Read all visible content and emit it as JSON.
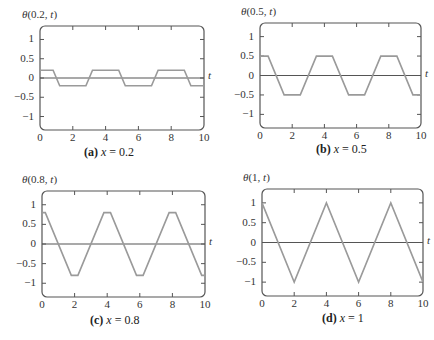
{
  "colors": {
    "frame": "#555555",
    "axis_line": "#555555",
    "curve": "#9a9a9a",
    "text": "#333333"
  },
  "chart_data": [
    {
      "type": "line",
      "panel": "a",
      "title": "θ(0.2, t)",
      "title_func": "θ",
      "title_args": "(0.2, ",
      "title_var": "t",
      "caption_tag": "(a)",
      "caption_var": "x",
      "caption_eq": " = 0.2",
      "xlabel": "t",
      "ylabel": "θ(0.2, t)",
      "xlim": [
        0,
        10
      ],
      "ylim": [
        -1.35,
        1.35
      ],
      "xticks": [
        0,
        2,
        4,
        6,
        8,
        10
      ],
      "yticks": [
        1,
        0.5,
        0,
        -0.5,
        -1
      ],
      "ytick_labels": [
        "1",
        "0.5",
        "0",
        "−0.5",
        "−1"
      ],
      "grid": false,
      "x": [
        0,
        0.8,
        1.2,
        2.8,
        3.2,
        4.8,
        5.2,
        6.8,
        7.2,
        8.8,
        9.2,
        10
      ],
      "y": [
        0.2,
        0.2,
        -0.2,
        -0.2,
        0.2,
        0.2,
        -0.2,
        -0.2,
        0.2,
        0.2,
        -0.2,
        -0.2
      ]
    },
    {
      "type": "line",
      "panel": "b",
      "title": "θ(0.5, t)",
      "title_func": "θ",
      "title_args": "(0.5, ",
      "title_var": "t",
      "caption_tag": "(b)",
      "caption_var": "x",
      "caption_eq": " = 0.5",
      "xlabel": "t",
      "ylabel": "θ(0.5, t)",
      "xlim": [
        0,
        10
      ],
      "ylim": [
        -1.35,
        1.35
      ],
      "xticks": [
        0,
        2,
        4,
        6,
        8,
        10
      ],
      "yticks": [
        1,
        0.5,
        0,
        -0.5,
        -1
      ],
      "ytick_labels": [
        "1",
        "0.5",
        "0",
        "−0.5",
        "−1"
      ],
      "grid": false,
      "x": [
        0,
        0.5,
        1.5,
        2.5,
        3.5,
        4.5,
        5.5,
        6.5,
        7.5,
        8.5,
        9.5,
        10
      ],
      "y": [
        0.5,
        0.5,
        -0.5,
        -0.5,
        0.5,
        0.5,
        -0.5,
        -0.5,
        0.5,
        0.5,
        -0.5,
        -0.5
      ]
    },
    {
      "type": "line",
      "panel": "c",
      "title": "θ(0.8, t)",
      "title_func": "θ",
      "title_args": "(0.8, ",
      "title_var": "t",
      "caption_tag": "(c)",
      "caption_var": "x",
      "caption_eq": " = 0.8",
      "xlabel": "t",
      "ylabel": "θ(0.8, t)",
      "xlim": [
        0,
        10
      ],
      "ylim": [
        -1.35,
        1.35
      ],
      "xticks": [
        0,
        2,
        4,
        6,
        8,
        10
      ],
      "yticks": [
        1,
        0.5,
        0,
        -0.5,
        -1
      ],
      "ytick_labels": [
        "1",
        "0.5",
        "0",
        "−0.5",
        "−1"
      ],
      "grid": false,
      "x": [
        0,
        0.2,
        1.8,
        2.2,
        3.8,
        4.2,
        5.8,
        6.2,
        7.8,
        8.2,
        9.8,
        10
      ],
      "y": [
        0.8,
        0.8,
        -0.8,
        -0.8,
        0.8,
        0.8,
        -0.8,
        -0.8,
        0.8,
        0.8,
        -0.8,
        -0.8
      ]
    },
    {
      "type": "line",
      "panel": "d",
      "title": "θ(1, t)",
      "title_func": "θ",
      "title_args": "(1, ",
      "title_var": "t",
      "caption_tag": "(d)",
      "caption_var": "x",
      "caption_eq": " = 1",
      "xlabel": "t",
      "ylabel": "θ(1, t)",
      "xlim": [
        0,
        10
      ],
      "ylim": [
        -1.35,
        1.35
      ],
      "xticks": [
        0,
        2,
        4,
        6,
        8,
        10
      ],
      "yticks": [
        1,
        0.5,
        0,
        -0.5,
        -1
      ],
      "ytick_labels": [
        "1",
        "0.5",
        "0",
        "−0.5",
        "−1"
      ],
      "grid": false,
      "x": [
        0,
        2,
        4,
        6,
        8,
        10
      ],
      "y": [
        1,
        -1,
        1,
        -1,
        1,
        -1
      ]
    }
  ]
}
